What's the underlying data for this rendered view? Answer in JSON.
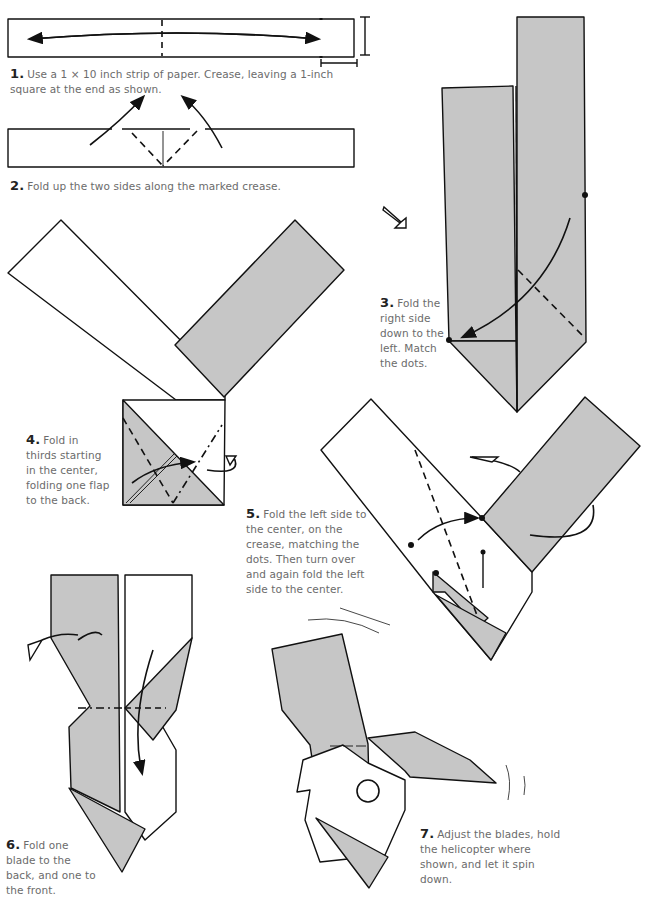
{
  "document": {
    "type": "origami-instructions",
    "model": "helicopter",
    "colors": {
      "paper_back": "#c6c6c6",
      "paper_front": "#ffffff",
      "line": "#111111",
      "caption_text": "#6b6b6b"
    }
  },
  "steps": [
    {
      "number": "1.",
      "text": "Use a 1 × 10 inch strip of paper. Crease, leaving a 1-inch square at the end as shown."
    },
    {
      "number": "2.",
      "text": "Fold up the two sides along the marked crease."
    },
    {
      "number": "3.",
      "text": "Fold the right side down to the left. Match the dots."
    },
    {
      "number": "4.",
      "text": "Fold in thirds starting in the center, folding one flap to the back."
    },
    {
      "number": "5.",
      "text": "Fold the left side to the center, on the crease, matching the dots. Then turn over and again fold the left side to the center."
    },
    {
      "number": "6.",
      "text": "Fold one blade to the back, and one to the front."
    },
    {
      "number": "7.",
      "text": "Adjust the blades, hold the helicopter where shown, and let it spin down."
    }
  ],
  "symbols": {
    "valley_fold": "dashed-line",
    "mountain_fold": "dash-dot-line",
    "turn_over": "loop-arrow",
    "match_points": "dot",
    "hold_point": "circle"
  }
}
